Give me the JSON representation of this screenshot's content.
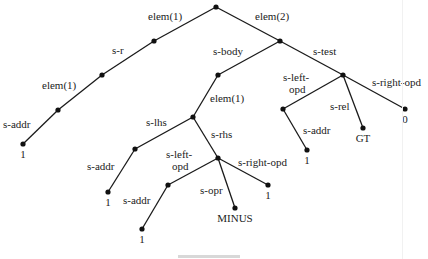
{
  "diagram": {
    "type": "tree",
    "nodes": [
      {
        "id": "root",
        "x": 216,
        "y": 7,
        "label": ""
      },
      {
        "id": "n1",
        "x": 154,
        "y": 41,
        "label": ""
      },
      {
        "id": "n2",
        "x": 102,
        "y": 75,
        "label": ""
      },
      {
        "id": "n3",
        "x": 58,
        "y": 110,
        "label": ""
      },
      {
        "id": "n4",
        "x": 23,
        "y": 144,
        "label": "1"
      },
      {
        "id": "n5",
        "x": 280,
        "y": 41,
        "label": ""
      },
      {
        "id": "n6",
        "x": 218,
        "y": 75,
        "label": ""
      },
      {
        "id": "n7",
        "x": 193,
        "y": 117,
        "label": ""
      },
      {
        "id": "n8",
        "x": 135,
        "y": 149,
        "label": ""
      },
      {
        "id": "n9",
        "x": 108,
        "y": 192,
        "label": "1"
      },
      {
        "id": "n10",
        "x": 218,
        "y": 158,
        "label": ""
      },
      {
        "id": "n11",
        "x": 168,
        "y": 185,
        "label": ""
      },
      {
        "id": "n12",
        "x": 142,
        "y": 229,
        "label": "1"
      },
      {
        "id": "n13",
        "x": 235,
        "y": 208,
        "label": "MINUS"
      },
      {
        "id": "n14",
        "x": 268,
        "y": 185,
        "label": "1"
      },
      {
        "id": "n15",
        "x": 343,
        "y": 75,
        "label": ""
      },
      {
        "id": "n16",
        "x": 283,
        "y": 109,
        "label": ""
      },
      {
        "id": "n17",
        "x": 307,
        "y": 150,
        "label": "1"
      },
      {
        "id": "n18",
        "x": 363,
        "y": 128,
        "label": "GT"
      },
      {
        "id": "n19",
        "x": 405,
        "y": 109,
        "label": "0"
      }
    ],
    "edges": [
      {
        "from": "root",
        "to": "n1",
        "label": "elem(1)",
        "lx": 148,
        "ly": 20
      },
      {
        "from": "n1",
        "to": "n2",
        "label": "s-r",
        "lx": 112,
        "ly": 54
      },
      {
        "from": "n2",
        "to": "n3",
        "label": "elem(1)",
        "lx": 42,
        "ly": 89
      },
      {
        "from": "n3",
        "to": "n4",
        "label": "s-addr",
        "lx": 3,
        "ly": 128
      },
      {
        "from": "root",
        "to": "n5",
        "label": "elem(2)",
        "lx": 255,
        "ly": 20
      },
      {
        "from": "n5",
        "to": "n6",
        "label": "s-body",
        "lx": 213,
        "ly": 55
      },
      {
        "from": "n5",
        "to": "n15",
        "label": "s-test",
        "lx": 313,
        "ly": 55
      },
      {
        "from": "n6",
        "to": "n7",
        "label": "elem(1)",
        "lx": 210,
        "ly": 102
      },
      {
        "from": "n7",
        "to": "n8",
        "label": "s-lhs",
        "lx": 146,
        "ly": 126
      },
      {
        "from": "n8",
        "to": "n9",
        "label": "s-addr",
        "lx": 87,
        "ly": 170
      },
      {
        "from": "n7",
        "to": "n10",
        "label": "s-rhs",
        "lx": 211,
        "ly": 138
      },
      {
        "from": "n10",
        "to": "n11",
        "label": "s-left-\nopd",
        "lx": 166,
        "ly": 158
      },
      {
        "from": "n11",
        "to": "n12",
        "label": "s-addr",
        "lx": 123,
        "ly": 204
      },
      {
        "from": "n10",
        "to": "n13",
        "label": "s-opr",
        "lx": 200,
        "ly": 194
      },
      {
        "from": "n10",
        "to": "n14",
        "label": "s-right-opd",
        "lx": 238,
        "ly": 166
      },
      {
        "from": "n15",
        "to": "n16",
        "label": "s-left-\nopd",
        "lx": 283,
        "ly": 81
      },
      {
        "from": "n16",
        "to": "n17",
        "label": "s-addr",
        "lx": 303,
        "ly": 134
      },
      {
        "from": "n15",
        "to": "n18",
        "label": "s-rel",
        "lx": 330,
        "ly": 110
      },
      {
        "from": "n15",
        "to": "n19",
        "label": "s-right-opd",
        "lx": 372,
        "ly": 86
      }
    ]
  }
}
